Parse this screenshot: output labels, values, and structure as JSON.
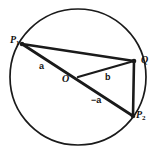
{
  "figure": {
    "background_color": "#ffffff",
    "stroke_color": "#1a1a1a"
  },
  "circle": {
    "center_x": 78,
    "center_y": 77,
    "radius": 68,
    "stroke_width": 1.6,
    "fill": "none"
  },
  "points": [
    {
      "id": "P1",
      "label": "P",
      "subscript": "1",
      "x": 22,
      "y": 44
    },
    {
      "id": "Q",
      "label": "Q",
      "subscript": "",
      "x": 134,
      "y": 61
    },
    {
      "id": "P2",
      "label": "P",
      "subscript": "2",
      "x": 133,
      "y": 116
    },
    {
      "id": "O",
      "label": "O",
      "subscript": "",
      "x": 78,
      "y": 77
    }
  ],
  "segments": [
    {
      "name": "chord-p1-q",
      "from": "P1",
      "to": "Q",
      "stroke_width": 2.2
    },
    {
      "name": "chord-q-p2",
      "from": "Q",
      "to": "P2",
      "stroke_width": 2.4
    },
    {
      "name": "diameter-p1-p2",
      "from": "P1",
      "to": "P2",
      "stroke_width": 2.6
    },
    {
      "name": "radius-o-q",
      "from": "O",
      "to": "Q",
      "stroke_width": 2.2
    }
  ],
  "labels": {
    "p1": "P",
    "p1_sub": "1",
    "q": "Q",
    "p2": "P",
    "p2_sub": "2",
    "o": "O",
    "vector_a": "a",
    "vector_b": "b",
    "vector_neg_a": "−a"
  }
}
